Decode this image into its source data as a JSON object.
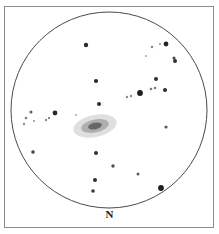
{
  "figure": {
    "kind": "telescope-eyepiece-sketch",
    "background_color": "#ffffff",
    "frame": {
      "x": 4,
      "y": 6,
      "width": 210,
      "height": 222,
      "stroke_color": "#8c8c8c",
      "stroke_width": 1
    },
    "field_circle": {
      "center_x": 109,
      "center_y": 110,
      "radius": 98,
      "stroke_color": "#4a4a4a",
      "stroke_width": 1,
      "fill": "none"
    },
    "orientation": {
      "label": "N",
      "position": "bottom-center",
      "x": 109,
      "y": 215,
      "color": "#1a1a1a"
    }
  },
  "galaxy": {
    "name": "central-galaxy",
    "center_x": 95,
    "center_y": 126,
    "halo_rx": 22,
    "halo_ry": 11,
    "mid_rx": 14,
    "mid_ry": 6.5,
    "core_rx": 7,
    "core_ry": 3.2,
    "rotation_deg": -12,
    "halo_color": "#b8b8b8",
    "mid_color": "#8f8f8f",
    "core_color": "#5a5a5a"
  },
  "stars": [
    {
      "id": "s01",
      "x": 86,
      "y": 45,
      "r": 2.2,
      "color": "#2b2b2b"
    },
    {
      "id": "s02",
      "x": 152,
      "y": 47,
      "r": 1.3,
      "color": "#8a8a8a"
    },
    {
      "id": "s03",
      "x": 160,
      "y": 44,
      "r": 1.1,
      "color": "#9a9a9a"
    },
    {
      "id": "s04",
      "x": 166,
      "y": 44,
      "r": 2.4,
      "color": "#262626"
    },
    {
      "id": "s05",
      "x": 174,
      "y": 58,
      "r": 1.6,
      "color": "#4a4a4a"
    },
    {
      "id": "s06",
      "x": 175,
      "y": 61,
      "r": 2.0,
      "color": "#2f2f2f"
    },
    {
      "id": "s07",
      "x": 96,
      "y": 81,
      "r": 2.1,
      "color": "#2b2b2b"
    },
    {
      "id": "s08",
      "x": 156,
      "y": 79,
      "r": 2.0,
      "color": "#303030"
    },
    {
      "id": "s09",
      "x": 151,
      "y": 89,
      "r": 1.3,
      "color": "#7a7a7a"
    },
    {
      "id": "s10",
      "x": 155,
      "y": 88,
      "r": 1.3,
      "color": "#7a7a7a"
    },
    {
      "id": "s11",
      "x": 165,
      "y": 90,
      "r": 2.0,
      "color": "#2e2e2e"
    },
    {
      "id": "s12",
      "x": 140,
      "y": 93,
      "r": 2.9,
      "color": "#1f1f1f"
    },
    {
      "id": "s13",
      "x": 127,
      "y": 97,
      "r": 1.2,
      "color": "#8a8a8a"
    },
    {
      "id": "s14",
      "x": 131,
      "y": 96,
      "r": 1.2,
      "color": "#8a8a8a"
    },
    {
      "id": "s15",
      "x": 99,
      "y": 104,
      "r": 2.0,
      "color": "#2f2f2f"
    },
    {
      "id": "s16",
      "x": 31,
      "y": 112,
      "r": 1.5,
      "color": "#5e5e5e"
    },
    {
      "id": "s17",
      "x": 26,
      "y": 118,
      "r": 1.3,
      "color": "#7d7d7d"
    },
    {
      "id": "s18",
      "x": 24,
      "y": 124,
      "r": 1.2,
      "color": "#8a8a8a"
    },
    {
      "id": "s19",
      "x": 34,
      "y": 121,
      "r": 1.1,
      "color": "#9a9a9a"
    },
    {
      "id": "s20",
      "x": 46,
      "y": 120,
      "r": 1.2,
      "color": "#8a8a8a"
    },
    {
      "id": "s21",
      "x": 49,
      "y": 118,
      "r": 1.2,
      "color": "#8a8a8a"
    },
    {
      "id": "s22",
      "x": 55,
      "y": 113,
      "r": 2.4,
      "color": "#282828"
    },
    {
      "id": "s23",
      "x": 166,
      "y": 127,
      "r": 1.6,
      "color": "#5a5a5a"
    },
    {
      "id": "s24",
      "x": 33,
      "y": 152,
      "r": 1.8,
      "color": "#444444"
    },
    {
      "id": "s25",
      "x": 96,
      "y": 153,
      "r": 2.0,
      "color": "#303030"
    },
    {
      "id": "s26",
      "x": 113,
      "y": 166,
      "r": 1.7,
      "color": "#4f4f4f"
    },
    {
      "id": "s27",
      "x": 138,
      "y": 174,
      "r": 1.5,
      "color": "#5e5e5e"
    },
    {
      "id": "s28",
      "x": 95,
      "y": 180,
      "r": 2.0,
      "color": "#2e2e2e"
    },
    {
      "id": "s29",
      "x": 93,
      "y": 191,
      "r": 1.8,
      "color": "#3c3c3c"
    },
    {
      "id": "s30",
      "x": 161,
      "y": 188,
      "r": 2.9,
      "color": "#1f1f1f"
    },
    {
      "id": "s31",
      "x": 76,
      "y": 115,
      "r": 1.0,
      "color": "#a6a6a6"
    },
    {
      "id": "s32",
      "x": 146,
      "y": 56,
      "r": 1.0,
      "color": "#a6a6a6"
    }
  ]
}
